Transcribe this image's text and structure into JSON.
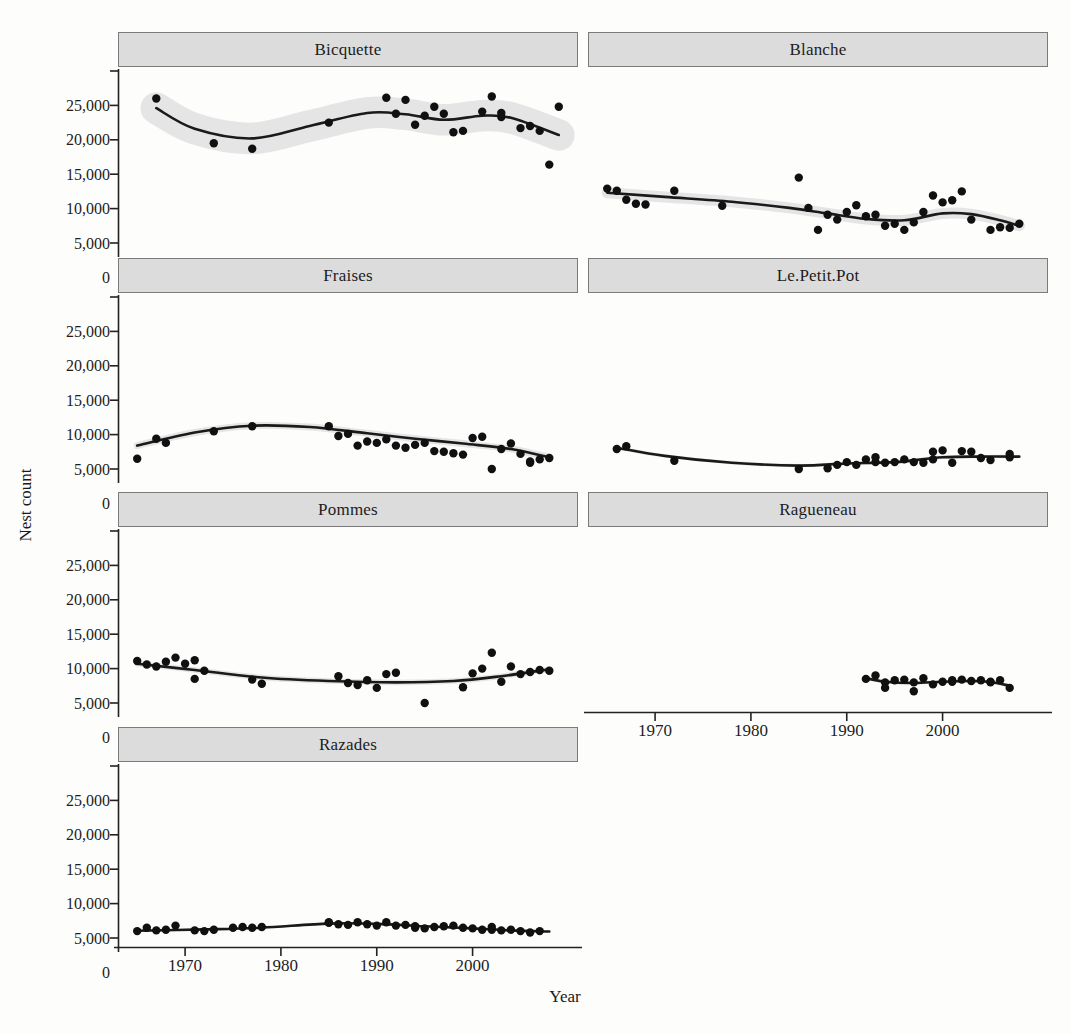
{
  "colors": {
    "point": "#101010",
    "trend": "#1a1a1a",
    "band": "#e2e2e2",
    "strip_fill": "#dcdcdc",
    "strip_border": "#7b7b7b",
    "axis": "#222222",
    "text": "#1d1d1d",
    "background": "#fdfdfc"
  },
  "chart_data": {
    "type": "scatter",
    "title": "",
    "xlabel": "Year",
    "ylabel": "Nest count",
    "x_range": [
      1963,
      2011
    ],
    "y_range": [
      0,
      25000
    ],
    "x_ticks": [
      {
        "v": 1970,
        "label": "1970"
      },
      {
        "v": 1980,
        "label": "1980"
      },
      {
        "v": 1990,
        "label": "1990"
      },
      {
        "v": 2000,
        "label": "2000"
      }
    ],
    "y_ticks": [
      {
        "v": 0,
        "label": "0"
      },
      {
        "v": 5000,
        "label": "5,000"
      },
      {
        "v": 10000,
        "label": "10,000"
      },
      {
        "v": 15000,
        "label": "15,000"
      },
      {
        "v": 20000,
        "label": "20,000"
      },
      {
        "v": 25000,
        "label": "25,000"
      }
    ],
    "layout": {
      "rows": 4,
      "cols": 2,
      "grid": false,
      "legend": "none",
      "smoother": "loess with confidence band"
    },
    "panels": [
      {
        "name": "Bicquette",
        "row": 0,
        "col": 0,
        "show_y_axis": true,
        "show_x_axis": false,
        "band_halfwidth": 2300,
        "trend": [
          [
            1967,
            19600
          ],
          [
            1971,
            16600
          ],
          [
            1977,
            15200
          ],
          [
            1983,
            17000
          ],
          [
            1989,
            18900
          ],
          [
            1993,
            18700
          ],
          [
            1997,
            17900
          ],
          [
            2001,
            18500
          ],
          [
            2004,
            18200
          ],
          [
            2009,
            15700
          ]
        ],
        "points": [
          [
            1967,
            21000
          ],
          [
            1973,
            14500
          ],
          [
            1977,
            13700
          ],
          [
            1985,
            17500
          ],
          [
            1991,
            21100
          ],
          [
            1992,
            18800
          ],
          [
            1993,
            20800
          ],
          [
            1994,
            17200
          ],
          [
            1995,
            18500
          ],
          [
            1996,
            19800
          ],
          [
            1997,
            18800
          ],
          [
            1998,
            16100
          ],
          [
            1999,
            16300
          ],
          [
            2001,
            19100
          ],
          [
            2002,
            21300
          ],
          [
            2003,
            18900
          ],
          [
            2003,
            18300
          ],
          [
            2005,
            16700
          ],
          [
            2006,
            17000
          ],
          [
            2007,
            16300
          ],
          [
            2008,
            11400
          ],
          [
            2009,
            19800
          ]
        ]
      },
      {
        "name": "Blanche",
        "row": 0,
        "col": 1,
        "show_y_axis": false,
        "show_x_axis": false,
        "band_halfwidth": 800,
        "trend": [
          [
            1965,
            7300
          ],
          [
            1971,
            6700
          ],
          [
            1978,
            6000
          ],
          [
            1984,
            5100
          ],
          [
            1988,
            4300
          ],
          [
            1992,
            3500
          ],
          [
            1996,
            3300
          ],
          [
            2000,
            4300
          ],
          [
            2003,
            4200
          ],
          [
            2006,
            3300
          ],
          [
            2008,
            2500
          ]
        ],
        "points": [
          [
            1965,
            7900
          ],
          [
            1966,
            7600
          ],
          [
            1967,
            6300
          ],
          [
            1968,
            5700
          ],
          [
            1969,
            5600
          ],
          [
            1972,
            7600
          ],
          [
            1977,
            5400
          ],
          [
            1985,
            9500
          ],
          [
            1986,
            5100
          ],
          [
            1987,
            1900
          ],
          [
            1988,
            4100
          ],
          [
            1989,
            3400
          ],
          [
            1990,
            4500
          ],
          [
            1991,
            5500
          ],
          [
            1992,
            3900
          ],
          [
            1993,
            4100
          ],
          [
            1994,
            2500
          ],
          [
            1995,
            2800
          ],
          [
            1996,
            1900
          ],
          [
            1997,
            3000
          ],
          [
            1998,
            4500
          ],
          [
            1999,
            6900
          ],
          [
            2000,
            5900
          ],
          [
            2001,
            6200
          ],
          [
            2002,
            7500
          ],
          [
            2003,
            3400
          ],
          [
            2005,
            1900
          ],
          [
            2006,
            2300
          ],
          [
            2007,
            2200
          ],
          [
            2008,
            2800
          ]
        ]
      },
      {
        "name": "Fraises",
        "row": 1,
        "col": 0,
        "show_y_axis": true,
        "show_x_axis": false,
        "band_halfwidth": 500,
        "trend": [
          [
            1965,
            3400
          ],
          [
            1971,
            5300
          ],
          [
            1977,
            6300
          ],
          [
            1983,
            6100
          ],
          [
            1989,
            5200
          ],
          [
            1994,
            4400
          ],
          [
            1999,
            3700
          ],
          [
            2004,
            2900
          ],
          [
            2008,
            1700
          ]
        ],
        "points": [
          [
            1965,
            1500
          ],
          [
            1967,
            4400
          ],
          [
            1968,
            3800
          ],
          [
            1973,
            5500
          ],
          [
            1977,
            6200
          ],
          [
            1985,
            6200
          ],
          [
            1986,
            4800
          ],
          [
            1987,
            5100
          ],
          [
            1988,
            3400
          ],
          [
            1989,
            4000
          ],
          [
            1990,
            3800
          ],
          [
            1991,
            4300
          ],
          [
            1992,
            3400
          ],
          [
            1993,
            3100
          ],
          [
            1994,
            3500
          ],
          [
            1995,
            3800
          ],
          [
            1996,
            2600
          ],
          [
            1997,
            2500
          ],
          [
            1998,
            2300
          ],
          [
            1999,
            2100
          ],
          [
            2000,
            4500
          ],
          [
            2001,
            4700
          ],
          [
            2002,
            0
          ],
          [
            2003,
            2900
          ],
          [
            2004,
            3700
          ],
          [
            2005,
            2200
          ],
          [
            2006,
            1100
          ],
          [
            2006,
            900
          ],
          [
            2007,
            1400
          ],
          [
            2008,
            1600
          ]
        ]
      },
      {
        "name": "Le.Petit.Pot",
        "row": 1,
        "col": 1,
        "show_y_axis": false,
        "show_x_axis": false,
        "band_halfwidth": 250,
        "trend": [
          [
            1966,
            3100
          ],
          [
            1971,
            1900
          ],
          [
            1978,
            900
          ],
          [
            1985,
            500
          ],
          [
            1990,
            800
          ],
          [
            1995,
            1000
          ],
          [
            2000,
            1700
          ],
          [
            2004,
            1800
          ],
          [
            2008,
            1800
          ]
        ],
        "points": [
          [
            1966,
            2900
          ],
          [
            1967,
            3300
          ],
          [
            1972,
            1200
          ],
          [
            1985,
            0
          ],
          [
            1988,
            100
          ],
          [
            1989,
            600
          ],
          [
            1990,
            1000
          ],
          [
            1991,
            600
          ],
          [
            1992,
            1400
          ],
          [
            1993,
            1000
          ],
          [
            1993,
            1700
          ],
          [
            1994,
            900
          ],
          [
            1995,
            1000
          ],
          [
            1996,
            1400
          ],
          [
            1997,
            1000
          ],
          [
            1998,
            900
          ],
          [
            1999,
            1400
          ],
          [
            1999,
            2500
          ],
          [
            2000,
            2700
          ],
          [
            2001,
            900
          ],
          [
            2002,
            2600
          ],
          [
            2003,
            2500
          ],
          [
            2004,
            1600
          ],
          [
            2005,
            1300
          ],
          [
            2007,
            1700
          ],
          [
            2007,
            2200
          ]
        ]
      },
      {
        "name": "Pommes",
        "row": 2,
        "col": 0,
        "show_y_axis": true,
        "show_x_axis": false,
        "band_halfwidth": 400,
        "trend": [
          [
            1965,
            5700
          ],
          [
            1971,
            4800
          ],
          [
            1978,
            3700
          ],
          [
            1985,
            3200
          ],
          [
            1992,
            3000
          ],
          [
            1998,
            3200
          ],
          [
            2003,
            3900
          ],
          [
            2008,
            4900
          ]
        ],
        "points": [
          [
            1965,
            6100
          ],
          [
            1966,
            5600
          ],
          [
            1967,
            5300
          ],
          [
            1968,
            6000
          ],
          [
            1969,
            6600
          ],
          [
            1970,
            5700
          ],
          [
            1971,
            6200
          ],
          [
            1971,
            3500
          ],
          [
            1972,
            4700
          ],
          [
            1977,
            3400
          ],
          [
            1978,
            2800
          ],
          [
            1986,
            3900
          ],
          [
            1987,
            2900
          ],
          [
            1988,
            2600
          ],
          [
            1989,
            3300
          ],
          [
            1990,
            2200
          ],
          [
            1991,
            4200
          ],
          [
            1992,
            4400
          ],
          [
            1995,
            0
          ],
          [
            1999,
            2300
          ],
          [
            2000,
            4300
          ],
          [
            2001,
            5000
          ],
          [
            2002,
            7300
          ],
          [
            2003,
            3100
          ],
          [
            2004,
            5300
          ],
          [
            2005,
            4200
          ],
          [
            2006,
            4500
          ],
          [
            2007,
            4800
          ],
          [
            2008,
            4700
          ]
        ]
      },
      {
        "name": "Ragueneau",
        "row": 2,
        "col": 1,
        "show_y_axis": false,
        "show_x_axis": true,
        "band_halfwidth": 250,
        "trend": [
          [
            1992,
            3600
          ],
          [
            1994,
            3100
          ],
          [
            1997,
            2900
          ],
          [
            2000,
            3100
          ],
          [
            2003,
            3200
          ],
          [
            2005,
            3050
          ],
          [
            2007,
            2500
          ]
        ],
        "points": [
          [
            1992,
            3500
          ],
          [
            1993,
            4000
          ],
          [
            1994,
            3000
          ],
          [
            1994,
            2200
          ],
          [
            1995,
            3300
          ],
          [
            1996,
            3400
          ],
          [
            1997,
            3000
          ],
          [
            1997,
            1700
          ],
          [
            1998,
            3600
          ],
          [
            1999,
            2700
          ],
          [
            2000,
            3100
          ],
          [
            2001,
            3300
          ],
          [
            2001,
            3100
          ],
          [
            2002,
            3400
          ],
          [
            2003,
            3200
          ],
          [
            2004,
            3300
          ],
          [
            2005,
            3100
          ],
          [
            2005,
            3000
          ],
          [
            2006,
            3300
          ],
          [
            2007,
            2200
          ]
        ]
      },
      {
        "name": "Razades",
        "row": 3,
        "col": 0,
        "show_y_axis": true,
        "show_x_axis": true,
        "band_halfwidth": 150,
        "trend": [
          [
            1965,
            1050
          ],
          [
            1972,
            1250
          ],
          [
            1978,
            1500
          ],
          [
            1985,
            2100
          ],
          [
            1990,
            2050
          ],
          [
            1995,
            1700
          ],
          [
            2000,
            1400
          ],
          [
            2004,
            1100
          ],
          [
            2008,
            950
          ]
        ],
        "points": [
          [
            1965,
            1000
          ],
          [
            1966,
            1500
          ],
          [
            1967,
            1100
          ],
          [
            1968,
            1200
          ],
          [
            1969,
            1800
          ],
          [
            1971,
            1100
          ],
          [
            1972,
            1000
          ],
          [
            1973,
            1200
          ],
          [
            1975,
            1500
          ],
          [
            1976,
            1600
          ],
          [
            1977,
            1500
          ],
          [
            1978,
            1600
          ],
          [
            1985,
            2200
          ],
          [
            1985,
            2300
          ],
          [
            1986,
            2000
          ],
          [
            1987,
            1900
          ],
          [
            1988,
            2300
          ],
          [
            1989,
            2000
          ],
          [
            1990,
            1800
          ],
          [
            1991,
            2300
          ],
          [
            1992,
            1800
          ],
          [
            1993,
            1900
          ],
          [
            1994,
            1700
          ],
          [
            1994,
            1500
          ],
          [
            1995,
            1400
          ],
          [
            1996,
            1600
          ],
          [
            1997,
            1700
          ],
          [
            1998,
            1800
          ],
          [
            1999,
            1500
          ],
          [
            2000,
            1400
          ],
          [
            2001,
            1200
          ],
          [
            2002,
            1600
          ],
          [
            2002,
            1200
          ],
          [
            2003,
            1100
          ],
          [
            2004,
            1200
          ],
          [
            2005,
            1000
          ],
          [
            2006,
            800
          ],
          [
            2007,
            1000
          ]
        ]
      }
    ]
  }
}
